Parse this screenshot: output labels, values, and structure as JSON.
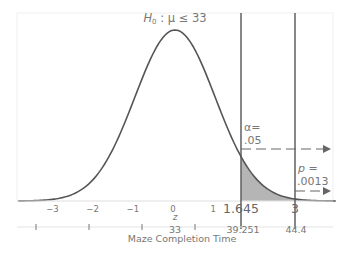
{
  "chart_data": {
    "type": "area",
    "title": "H0 : μ ≤ 33",
    "title_parts": {
      "h": "H",
      "sub": "0",
      "rest": " : μ ≤ 33"
    },
    "distribution": "standard normal",
    "xlabel_z": "z",
    "xlabel_raw": "Maze Completion Time",
    "z_ticks": [
      "−3",
      "−2",
      "−1",
      "0",
      "1"
    ],
    "z_tick_values": [
      -3,
      -2,
      -1,
      0,
      1
    ],
    "critical_z_label": "1.645",
    "critical_z": 1.645,
    "observed_z_label": "3",
    "observed_z": 3,
    "raw_labels": {
      "mean": "33",
      "critical": "39.251",
      "observed": "44.4"
    },
    "alpha": {
      "line1": "α=",
      "line2": ".05",
      "value": 0.05
    },
    "p_value": {
      "line1": "p =",
      "line2": ".0013",
      "value": 0.0013
    },
    "shaded_region": "z ≥ 1.645",
    "xlim_z": [
      -3.9,
      4.0
    ],
    "grid": false,
    "legend": "none"
  },
  "colors": {
    "curve": "#555555",
    "shade": "#b3b3b3",
    "lines": "#555555",
    "frame": "#eeeeee",
    "text": "#777777"
  }
}
